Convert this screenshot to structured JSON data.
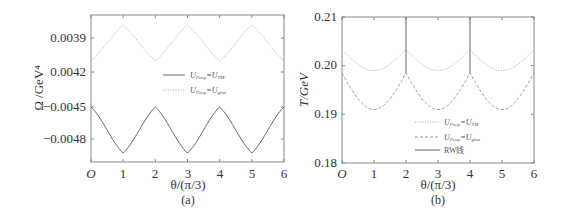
{
  "chart_data": [
    {
      "type": "line",
      "panel_label": "(a)",
      "xlabel": "θ/(π/3)",
      "ylabel": "Ω /GeV⁴",
      "x_ticks": [
        "O",
        "1",
        "2",
        "3",
        "4",
        "5",
        "6"
      ],
      "y_ticks": [
        "0.0039",
        "0.0042",
        "−0.0045",
        "−0.0048"
      ],
      "xlim": [
        0,
        6
      ],
      "grid": false,
      "legend_position": "center",
      "series": [
        {
          "name": "U_Poop=U_TM",
          "label_main": "U",
          "label_sub1": "Poop",
          "label_mid": "=U",
          "label_sub2": "TM",
          "style": "solid",
          "x": [
            0,
            1,
            2,
            3,
            4,
            5,
            6
          ],
          "values": [
            -0.0045,
            -0.00493,
            -0.0045,
            -0.00493,
            -0.0045,
            -0.00493,
            -0.0045
          ]
        },
        {
          "name": "U_Poop=U_glue",
          "label_main": "U",
          "label_sub1": "Poop",
          "label_mid": "=U",
          "label_sub2": "glue",
          "style": "dotted",
          "x": [
            0,
            1,
            2,
            3,
            4,
            5,
            6
          ],
          "values": [
            0.00378,
            0.00413,
            0.00378,
            0.00413,
            0.00378,
            0.00413,
            0.00378
          ]
        }
      ]
    },
    {
      "type": "line",
      "panel_label": "(b)",
      "xlabel": "θ/(π/3)",
      "ylabel": "T/GeV",
      "x_ticks": [
        "O",
        "1",
        "2",
        "3",
        "4",
        "5",
        "6"
      ],
      "y_ticks": [
        "0.21",
        "0.20",
        "0.19",
        "0.18"
      ],
      "xlim": [
        0,
        6
      ],
      "ylim": [
        0.18,
        0.21
      ],
      "grid": false,
      "legend_position": "lower center",
      "series": [
        {
          "name": "U_Poop=U_TM",
          "label_main": "U",
          "label_sub1": "Poop",
          "label_mid": "=U",
          "label_sub2": "TM",
          "style": "dotted",
          "x": [
            0,
            1,
            2,
            3,
            4,
            5,
            6
          ],
          "values": [
            0.2033,
            0.199,
            0.2033,
            0.199,
            0.2033,
            0.199,
            0.2033
          ]
        },
        {
          "name": "U_Poop=U_glue",
          "label_main": "U",
          "label_sub1": "Poop",
          "label_mid": "=U",
          "label_sub2": "glue",
          "style": "dashed",
          "x": [
            0,
            1,
            2,
            3,
            4,
            5,
            6
          ],
          "values": [
            0.1985,
            0.191,
            0.1985,
            0.191,
            0.1985,
            0.191,
            0.1985
          ]
        },
        {
          "name": "RW线",
          "label_plain": "RW线",
          "style": "solid",
          "x": [
            2,
            4
          ],
          "values_from": [
            0.21,
            0.21
          ],
          "values_to": [
            0.1985,
            0.1985
          ]
        }
      ]
    }
  ]
}
